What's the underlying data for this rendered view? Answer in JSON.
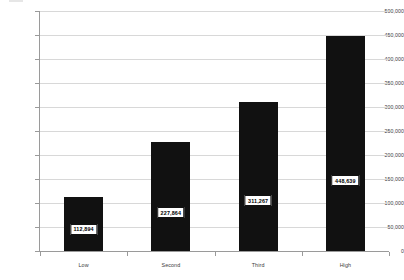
{
  "chart_data": {
    "type": "bar",
    "title": "",
    "subtitle": "",
    "xlabel": "",
    "ylabel": "",
    "categories": [
      "Low",
      "Second",
      "Third",
      "High"
    ],
    "values": [
      112894,
      227864,
      311267,
      448639
    ],
    "value_labels": [
      "112,894",
      "227,864",
      "311,267",
      "448,639"
    ],
    "ylim": [
      0,
      500000
    ],
    "ytick_step": 50000,
    "ytick_labels": [
      "500,000",
      "450,000",
      "400,000",
      "350,000",
      "300,000",
      "250,000",
      "200,000",
      "150,000",
      "100,000",
      "50,000",
      "0"
    ],
    "ytick_values": [
      500000,
      450000,
      400000,
      350000,
      300000,
      250000,
      200000,
      150000,
      100000,
      50000,
      0
    ],
    "grid": true,
    "grid_axis": "y",
    "legend": false,
    "legend_position": "none",
    "bar_color": "#111111",
    "grid_color": "#d8d8d8",
    "axis_color": "#9a9a9a",
    "label_box_fill": "#ffffff",
    "label_box_border": "#111111",
    "text_color": "#3c3c3c"
  }
}
